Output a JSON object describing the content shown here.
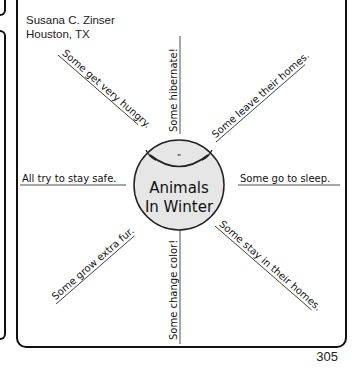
{
  "author": {
    "name": "Susana C. Zinser",
    "location": "Houston, TX"
  },
  "center": {
    "line1": "Animals",
    "line2": "In Winter",
    "fill": "#e6e6e6"
  },
  "spokes": {
    "top": "Some hibernate!",
    "top_right": "Some leave their homes.",
    "right": "Some go to sleep.",
    "bottom_right": "Some stay in their homes.",
    "bottom": "Some change color!",
    "bottom_left": "Some grow extra fur.",
    "left": "All try to stay safe.",
    "top_left": "Some get very hungry."
  },
  "page_number": "305"
}
